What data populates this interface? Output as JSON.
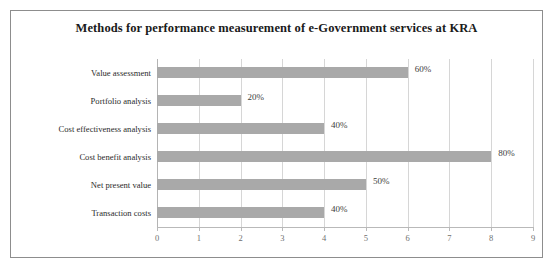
{
  "chart_data": {
    "type": "bar",
    "orientation": "horizontal",
    "title": "Methods for performance measurement of e-Government services at KRA",
    "categories": [
      "Value assessment",
      "Portfolio analysis",
      "Cost effectiveness analysis",
      "Cost benefit analysis",
      "Net present value",
      "Transaction costs"
    ],
    "values": [
      6,
      2,
      4,
      8,
      5,
      4
    ],
    "data_labels": [
      "60%",
      "20%",
      "40%",
      "80%",
      "50%",
      "40%"
    ],
    "xlabel": "",
    "ylabel": "",
    "xlim": [
      0,
      9
    ],
    "x_ticks": [
      "0",
      "1",
      "2",
      "3",
      "4",
      "5",
      "6",
      "7",
      "8",
      "9"
    ],
    "grid": true,
    "legend": false,
    "bar_color": "#a9a9a9",
    "gridline_color": "#d6d6d6",
    "border_color": "#8d8d8d",
    "title_color": "#1a1a1a"
  }
}
